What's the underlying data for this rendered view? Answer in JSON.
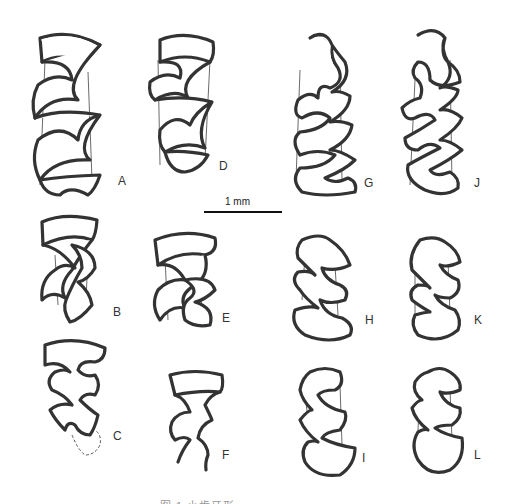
{
  "figure": {
    "scale_bar": {
      "label": "1 mm"
    },
    "caption": "图 1 小齿牙形 ……",
    "specimens": [
      {
        "id": "A",
        "column": 1,
        "row": 1
      },
      {
        "id": "B",
        "column": 1,
        "row": 2
      },
      {
        "id": "C",
        "column": 1,
        "row": 3
      },
      {
        "id": "D",
        "column": 2,
        "row": 1
      },
      {
        "id": "E",
        "column": 2,
        "row": 2
      },
      {
        "id": "F",
        "column": 2,
        "row": 3
      },
      {
        "id": "G",
        "column": 3,
        "row": 1
      },
      {
        "id": "H",
        "column": 3,
        "row": 2
      },
      {
        "id": "I",
        "column": 3,
        "row": 3
      },
      {
        "id": "J",
        "column": 4,
        "row": 1
      },
      {
        "id": "K",
        "column": 4,
        "row": 2
      },
      {
        "id": "L",
        "column": 4,
        "row": 3
      }
    ],
    "colors": {
      "line": "#333333",
      "background": "#ffffff"
    }
  }
}
